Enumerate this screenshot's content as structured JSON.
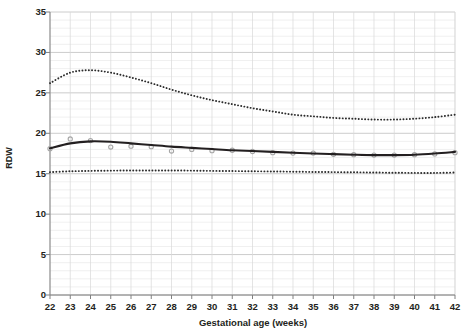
{
  "chart_data": {
    "type": "line",
    "title": "",
    "xlabel": "Gestational age (weeks)",
    "ylabel": "RDW",
    "xlim": [
      22,
      42
    ],
    "ylim": [
      0,
      35
    ],
    "y_major_step": 5,
    "y_minor_step": 1,
    "grid": true,
    "legend": "none",
    "x_tick_labels": [
      "22",
      "23",
      "24",
      "25",
      "26",
      "27",
      "28",
      "29",
      "30",
      "31",
      "32",
      "33",
      "34",
      "35",
      "36",
      "37",
      "38",
      "39",
      "40",
      "41",
      "42"
    ],
    "y_tick_labels": [
      "0",
      "5",
      "10",
      "15",
      "20",
      "25",
      "30",
      "35"
    ],
    "x": [
      22,
      23,
      24,
      25,
      26,
      27,
      28,
      29,
      30,
      31,
      32,
      33,
      34,
      35,
      36,
      37,
      38,
      39,
      40,
      41,
      42
    ],
    "series": [
      {
        "name": "upper-percentile",
        "style": "dotted",
        "color": "#2b2b2b",
        "values": [
          26.2,
          27.5,
          27.8,
          27.5,
          26.9,
          26.2,
          25.4,
          24.7,
          24.1,
          23.6,
          23.1,
          22.7,
          22.3,
          22.1,
          21.9,
          21.8,
          21.7,
          21.7,
          21.8,
          22.0,
          22.3
        ]
      },
      {
        "name": "mean-curve",
        "style": "solid",
        "color": "#231f20",
        "values": [
          18.15,
          18.75,
          19.0,
          18.95,
          18.75,
          18.55,
          18.35,
          18.2,
          18.05,
          17.9,
          17.8,
          17.7,
          17.6,
          17.5,
          17.42,
          17.35,
          17.3,
          17.3,
          17.35,
          17.5,
          17.7
        ]
      },
      {
        "name": "lower-percentile",
        "style": "dotted",
        "color": "#2b2b2b",
        "values": [
          15.2,
          15.3,
          15.35,
          15.38,
          15.4,
          15.4,
          15.4,
          15.38,
          15.35,
          15.33,
          15.3,
          15.28,
          15.25,
          15.22,
          15.2,
          15.18,
          15.15,
          15.12,
          15.1,
          15.1,
          15.15
        ]
      }
    ],
    "markers": {
      "name": "observed-means",
      "color": "#a6a6a6",
      "shape": "circle",
      "x": [
        22,
        23,
        24,
        25,
        26,
        27,
        28,
        29,
        30,
        31,
        32,
        33,
        34,
        35,
        36,
        37,
        38,
        39,
        40,
        41,
        42
      ],
      "values": [
        18.1,
        19.3,
        19.1,
        18.3,
        18.4,
        18.35,
        17.8,
        18.0,
        17.85,
        17.9,
        17.75,
        17.6,
        17.55,
        17.55,
        17.4,
        17.35,
        17.3,
        17.3,
        17.35,
        17.45,
        17.6
      ]
    }
  }
}
